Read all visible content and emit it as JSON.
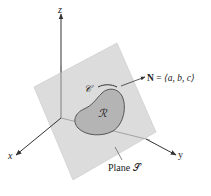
{
  "figure": {
    "axes": {
      "z_label": "z",
      "x_label": "x",
      "y_label": "y"
    },
    "plane_label": "Plane 𝒮",
    "region_label": "ℛ",
    "curve_label": "𝒞",
    "normal": {
      "symbol": "N",
      "equals": " = ",
      "vector": "⟨a, b, c⟩"
    },
    "colors": {
      "plane_fill": "#d6d6d6",
      "plane_edge": "#cfcfcf",
      "region_fill": "#b4b4b4",
      "region_edge": "#555555",
      "axis": "#333333",
      "text": "#222222"
    }
  }
}
